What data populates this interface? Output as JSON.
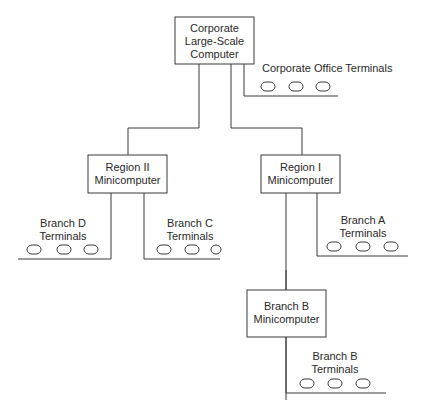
{
  "nodes": {
    "corporate": {
      "line1": "Corporate",
      "line2": "Large-Scale",
      "line3": "Computer"
    },
    "region2": {
      "line1": "Region II",
      "line2": "Minicomputer"
    },
    "region1": {
      "line1": "Region I",
      "line2": "Minicomputer"
    },
    "branchB": {
      "line1": "Branch B",
      "line2": "Minicomputer"
    }
  },
  "terminal_groups": {
    "corporate_office": {
      "label": "Corporate Office Terminals",
      "count": 3
    },
    "branch_d": {
      "line1": "Branch D",
      "line2": "Terminals",
      "count": 3
    },
    "branch_c": {
      "line1": "Branch C",
      "line2": "Terminals",
      "count": 3
    },
    "branch_a": {
      "line1": "Branch A",
      "line2": "Terminals",
      "count": 3
    },
    "branch_b": {
      "line1": "Branch B",
      "line2": "Terminals",
      "count": 3
    }
  },
  "colors": {
    "line": "#3a3a3a",
    "text": "#2a2a2a",
    "background": "#ffffff"
  }
}
